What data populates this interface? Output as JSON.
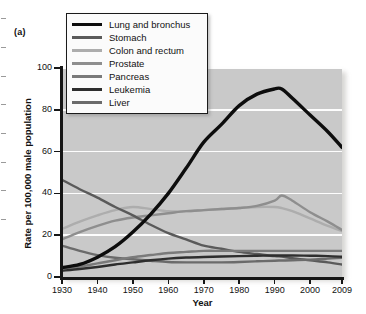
{
  "panel": {
    "label": "(a)"
  },
  "axes": {
    "x_title": "Year",
    "y_title": "Rate per 100,000 male population",
    "y_ticks": [
      "0",
      "20",
      "40",
      "60",
      "80",
      "100"
    ],
    "x_ticks": [
      "1930",
      "1940",
      "1950",
      "1960",
      "1970",
      "1980",
      "1990",
      "2000",
      "2009"
    ]
  },
  "legend": {
    "items": [
      {
        "label": "Lung and bronchus",
        "color": "#0d0d0d",
        "width": 3.4
      },
      {
        "label": "Stomach",
        "color": "#5a5a5a",
        "width": 2.4
      },
      {
        "label": "Colon and rectum",
        "color": "#adadad",
        "width": 2.4
      },
      {
        "label": "Prostate",
        "color": "#8e8e8e",
        "width": 2.4
      },
      {
        "label": "Pancreas",
        "color": "#7a7a7a",
        "width": 2.4
      },
      {
        "label": "Leukemia",
        "color": "#2e2e2e",
        "width": 2.4
      },
      {
        "label": "Liver",
        "color": "#6b6b6b",
        "width": 2.4
      }
    ]
  },
  "chart_data": {
    "type": "line",
    "title": "",
    "xlabel": "Year",
    "ylabel": "Rate per 100,000 male population",
    "xlim": [
      1930,
      2009
    ],
    "ylim": [
      0,
      100
    ],
    "grid": true,
    "gridlines_y": [
      20,
      40,
      60,
      80,
      100
    ],
    "legend_position": "top-left-inset",
    "x": [
      1930,
      1935,
      1940,
      1945,
      1950,
      1955,
      1960,
      1965,
      1970,
      1975,
      1980,
      1985,
      1990,
      1992,
      1995,
      2000,
      2005,
      2009
    ],
    "series": [
      {
        "name": "Lung and bronchus",
        "color": "#0d0d0d",
        "width": 3.4,
        "values": [
          4.5,
          6.0,
          9.5,
          14.5,
          21.5,
          30.0,
          40.0,
          52.0,
          64.5,
          73.0,
          82.0,
          87.5,
          90.0,
          90.0,
          85.5,
          77.5,
          69.5,
          62.0
        ]
      },
      {
        "name": "Stomach",
        "color": "#5a5a5a",
        "width": 2.4,
        "values": [
          46.5,
          42.0,
          38.0,
          33.5,
          29.5,
          25.0,
          21.0,
          18.0,
          15.0,
          13.5,
          12.0,
          11.0,
          10.0,
          9.8,
          9.0,
          8.0,
          7.0,
          6.0
        ]
      },
      {
        "name": "Colon and rectum",
        "color": "#adadad",
        "width": 2.4,
        "values": [
          23.0,
          26.5,
          29.5,
          32.0,
          33.5,
          32.5,
          31.5,
          31.5,
          32.0,
          32.5,
          33.0,
          33.5,
          33.5,
          33.0,
          31.5,
          28.0,
          24.5,
          22.0
        ]
      },
      {
        "name": "Prostate",
        "color": "#8e8e8e",
        "width": 2.4,
        "values": [
          18.0,
          21.5,
          24.5,
          27.0,
          28.5,
          29.5,
          30.5,
          31.5,
          32.0,
          32.5,
          33.0,
          34.0,
          36.5,
          39.0,
          36.5,
          31.0,
          26.5,
          22.5
        ]
      },
      {
        "name": "Pancreas",
        "color": "#7a7a7a",
        "width": 2.4,
        "values": [
          4.0,
          5.0,
          6.5,
          8.0,
          9.5,
          10.5,
          11.5,
          12.0,
          12.5,
          12.5,
          12.5,
          12.5,
          12.5,
          12.5,
          12.5,
          12.5,
          12.5,
          12.5
        ]
      },
      {
        "name": "Leukemia",
        "color": "#2e2e2e",
        "width": 2.4,
        "values": [
          3.0,
          3.8,
          4.8,
          6.0,
          7.0,
          8.0,
          8.8,
          9.3,
          9.6,
          9.8,
          10.0,
          10.2,
          10.3,
          10.3,
          10.3,
          10.2,
          10.0,
          9.7
        ]
      },
      {
        "name": "Liver",
        "color": "#6b6b6b",
        "width": 2.4,
        "values": [
          15.0,
          12.5,
          10.5,
          9.2,
          8.5,
          7.8,
          7.2,
          7.0,
          7.0,
          7.0,
          7.2,
          7.5,
          7.8,
          7.9,
          8.0,
          8.3,
          8.8,
          9.2
        ]
      }
    ]
  }
}
